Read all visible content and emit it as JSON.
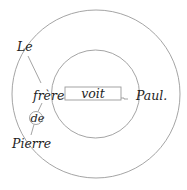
{
  "diagram": {
    "type": "dependency-stemma",
    "words": {
      "le": "Le",
      "frere": "frère",
      "de": "de",
      "pierre": "Pierre",
      "voit": "voit",
      "paul": "Paul."
    },
    "colors": {
      "line": "#9a9a9a",
      "text": "#1e1e1e",
      "background": "#ffffff"
    },
    "shapes": {
      "outer_circle": {
        "cx": 96,
        "cy": 94,
        "r": 84
      },
      "inner_circle": {
        "cx": 95.5,
        "cy": 94,
        "r": 44
      },
      "de_circle": {
        "cx": 36,
        "cy": 118,
        "r": 6.5
      },
      "verb_box": {
        "x": 65,
        "y": 87,
        "width": 56,
        "height": 13
      }
    }
  }
}
